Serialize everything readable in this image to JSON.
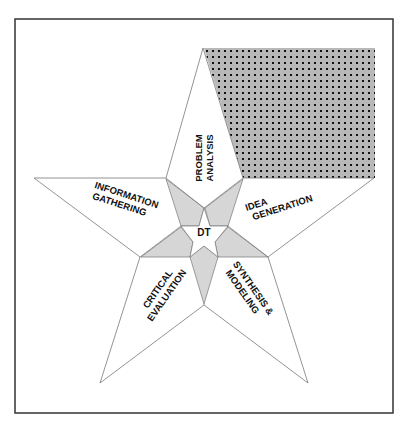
{
  "diagram": {
    "center_label": "DT",
    "colors": {
      "border": "#333333",
      "star_stroke": "#777777",
      "star_fill": "#ffffff",
      "inner_fill": "#d6d6d6",
      "dot_bg": "#b8b8b8",
      "dot": "#111111"
    },
    "arms": [
      {
        "id": "top",
        "line1": "PROBLEM",
        "line2": "ANALYSIS"
      },
      {
        "id": "left",
        "line1": "INFORMATION",
        "line2": "GATHERING"
      },
      {
        "id": "right",
        "line1": "IDEA",
        "line2": "GENERATION"
      },
      {
        "id": "lower-left",
        "line1": "CRITICAL",
        "line2": "EVALUATION"
      },
      {
        "id": "lower-right",
        "line1": "SYNTHESIS &",
        "line2": "MODELING"
      }
    ]
  }
}
